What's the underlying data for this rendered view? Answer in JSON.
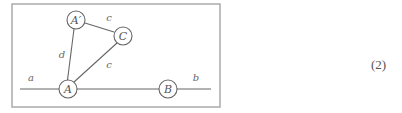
{
  "figure": {
    "frame": {
      "x": 12,
      "y": 4,
      "width": 208,
      "height": 103,
      "stroke": "#aaaaaa"
    },
    "line_color": "#666666",
    "main_line": {
      "x1": 20,
      "y1": 89,
      "x2": 211,
      "y2": 89
    },
    "nodes": [
      {
        "id": "A",
        "label": "A",
        "cx": 68,
        "cy": 89,
        "r": 9
      },
      {
        "id": "B",
        "label": "B",
        "cx": 168,
        "cy": 89,
        "r": 9
      },
      {
        "id": "A_prime",
        "label": "A′",
        "cx": 76,
        "cy": 20,
        "r": 9
      },
      {
        "id": "C",
        "label": "C",
        "cx": 123,
        "cy": 36,
        "r": 9
      }
    ],
    "edges": [
      {
        "from": "A",
        "to": "A_prime",
        "label": "d",
        "lx": 62,
        "ly": 58
      },
      {
        "from": "A",
        "to": "C",
        "label": "c",
        "lx": 108,
        "ly": 68
      },
      {
        "from": "A_prime",
        "to": "C",
        "label": "c",
        "lx": 109,
        "ly": 21
      }
    ],
    "line_labels": [
      {
        "label": "a",
        "x": 31,
        "y": 81
      },
      {
        "label": "b",
        "x": 196,
        "y": 81
      }
    ]
  },
  "equation_number": "(2)"
}
